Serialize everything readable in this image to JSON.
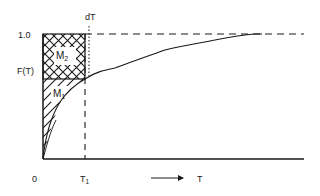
{
  "diagram": {
    "y_axis": {
      "label": "F(T)",
      "tick_top": "1.0"
    },
    "x_axis": {
      "origin": "0",
      "tick_t1": "T",
      "tick_t1_sub": "1",
      "arrow_label": "T"
    },
    "markers": {
      "dt_label": "dT"
    },
    "regions": {
      "upper": {
        "label": "M",
        "sub": "2",
        "fill": "cross-hatch"
      },
      "lower": {
        "label": "M",
        "sub": "1",
        "fill": "diagonal-hatch"
      }
    },
    "colors": {
      "ink": "#1a1a1a",
      "background": "#ffffff"
    }
  }
}
